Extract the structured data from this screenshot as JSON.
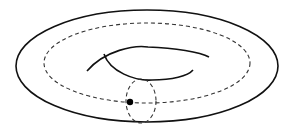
{
  "diagram": {
    "type": "torus",
    "colors": {
      "background": "#ffffff",
      "stroke": "#111111",
      "dashed": "#333333",
      "point": "#000000"
    },
    "elements": {
      "outer_boundary": {
        "cx": 147,
        "cy": 66,
        "rx": 131,
        "ry": 56,
        "style": "solid"
      },
      "longitude_loop": {
        "cx": 147,
        "cy": 63,
        "rx": 103,
        "ry": 40,
        "style": "dashed"
      },
      "inner_hole_upper": {
        "style": "solid"
      },
      "inner_hole_lower": {
        "style": "solid"
      },
      "meridian_loop": {
        "cx": 141,
        "cy": 101,
        "rx": 15,
        "ry": 22,
        "style": "dashed"
      },
      "base_point": {
        "cx": 130,
        "cy": 102,
        "r": 3.2
      }
    }
  }
}
